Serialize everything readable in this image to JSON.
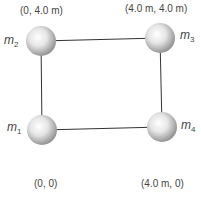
{
  "diagram": {
    "colors": {
      "line": "#333333",
      "text": "#444444",
      "sphere_light": "#ffffff",
      "sphere_dark": "#9a9a9a"
    },
    "masses": [
      {
        "id": "m1",
        "label": "m",
        "sub": "1",
        "coord": "(0, 0)"
      },
      {
        "id": "m2",
        "label": "m",
        "sub": "2",
        "coord": "(0, 4.0 m)"
      },
      {
        "id": "m3",
        "label": "m",
        "sub": "3",
        "coord": "(4.0 m, 4.0 m)"
      },
      {
        "id": "m4",
        "label": "m",
        "sub": "4",
        "coord": "(4.0 m, 0)"
      }
    ]
  }
}
